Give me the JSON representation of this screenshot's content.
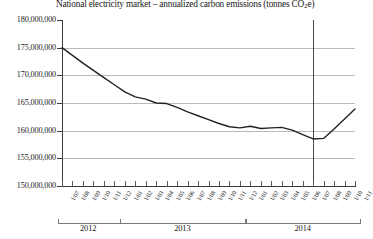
{
  "chart_data": {
    "type": "line",
    "title": "National electricity market – annualized carbon emissions (tonnes CO2e)",
    "title_prefix": "National electricity market – annualized carbon emissions (tonnes CO",
    "title_sub": "2",
    "title_suffix": "e)",
    "xlabel": "",
    "ylabel": "",
    "ylim": [
      150000000,
      180000000
    ],
    "ytick_values": [
      180000000,
      175000000,
      170000000,
      165000000,
      160000000,
      155000000,
      150000000
    ],
    "ytick_labels": [
      "180,000,000",
      "175,000,000",
      "170,000,000",
      "165,000,000",
      "160,000,000",
      "155,000,000",
      "150,000,000"
    ],
    "grid": true,
    "grid_color": "#b9b9b9",
    "line_color": "#222222",
    "line_width": 1.4,
    "legend": "none",
    "marker_line": {
      "label": "1/07",
      "x_index": 24,
      "color": "#4a4a4a"
    },
    "categories": [
      "1/07",
      "1/08",
      "1/09",
      "1/10",
      "1/11",
      "1/12",
      "1/01",
      "1/02",
      "1/03",
      "1/04",
      "1/05",
      "1/06",
      "1/07",
      "1/08",
      "1/09",
      "1/10",
      "1/11",
      "1/12",
      "1/01",
      "1/02",
      "1/03",
      "1/04",
      "1/05",
      "1/06",
      "1/07",
      "1/08",
      "1/09",
      "1/10",
      "1/11"
    ],
    "values": [
      175000000,
      173600000,
      172200000,
      170900000,
      169600000,
      168300000,
      167000000,
      166100000,
      165700000,
      165000000,
      164900000,
      164200000,
      163400000,
      162700000,
      162000000,
      161300000,
      160700000,
      160500000,
      160800000,
      160400000,
      160500000,
      160600000,
      160100000,
      159300000,
      158500000,
      158600000,
      160300000,
      162100000,
      163900000
    ],
    "year_groups": [
      {
        "label": "2012",
        "start_index": 0,
        "end_index": 5
      },
      {
        "label": "2013",
        "start_index": 6,
        "end_index": 17
      },
      {
        "label": "2014",
        "start_index": 18,
        "end_index": 28
      }
    ]
  }
}
